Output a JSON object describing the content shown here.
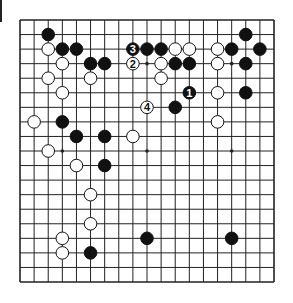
{
  "diagram": {
    "type": "go-board",
    "size": 19,
    "geometry": {
      "left": 20,
      "top": 20,
      "right": 274,
      "bottom": 282,
      "stone_radius": 6.3
    },
    "colors": {
      "line": "#222222",
      "black_stone": "#111111",
      "white_stone": "#ffffff",
      "background": "#ffffff"
    },
    "star_points": [
      [
        3,
        3
      ],
      [
        3,
        9
      ],
      [
        3,
        15
      ],
      [
        9,
        3
      ],
      [
        9,
        9
      ],
      [
        9,
        15
      ],
      [
        15,
        3
      ],
      [
        15,
        9
      ],
      [
        15,
        15
      ]
    ],
    "stones": [
      {
        "color": "black",
        "col": 2,
        "row": 1
      },
      {
        "color": "black",
        "col": 16,
        "row": 1
      },
      {
        "color": "white",
        "col": 2,
        "row": 2
      },
      {
        "color": "black",
        "col": 3,
        "row": 2
      },
      {
        "color": "black",
        "col": 4,
        "row": 2
      },
      {
        "color": "black",
        "col": 8,
        "row": 2,
        "label": "3"
      },
      {
        "color": "black",
        "col": 9,
        "row": 2
      },
      {
        "color": "black",
        "col": 10,
        "row": 2
      },
      {
        "color": "white",
        "col": 11,
        "row": 2
      },
      {
        "color": "white",
        "col": 12,
        "row": 2
      },
      {
        "color": "white",
        "col": 14,
        "row": 2
      },
      {
        "color": "black",
        "col": 15,
        "row": 2
      },
      {
        "color": "black",
        "col": 17,
        "row": 2
      },
      {
        "color": "white",
        "col": 3,
        "row": 3
      },
      {
        "color": "black",
        "col": 5,
        "row": 3
      },
      {
        "color": "black",
        "col": 6,
        "row": 3
      },
      {
        "color": "white",
        "col": 8,
        "row": 3,
        "label": "2"
      },
      {
        "color": "white",
        "col": 10,
        "row": 3
      },
      {
        "color": "black",
        "col": 11,
        "row": 3
      },
      {
        "color": "black",
        "col": 12,
        "row": 3
      },
      {
        "color": "white",
        "col": 14,
        "row": 3
      },
      {
        "color": "black",
        "col": 16,
        "row": 3
      },
      {
        "color": "white",
        "col": 2,
        "row": 4
      },
      {
        "color": "white",
        "col": 5,
        "row": 4
      },
      {
        "color": "white",
        "col": 10,
        "row": 4
      },
      {
        "color": "white",
        "col": 3,
        "row": 5
      },
      {
        "color": "black",
        "col": 12,
        "row": 5,
        "label": "1"
      },
      {
        "color": "white",
        "col": 14,
        "row": 5
      },
      {
        "color": "black",
        "col": 16,
        "row": 5
      },
      {
        "color": "white",
        "col": 9,
        "row": 6,
        "label": "4"
      },
      {
        "color": "black",
        "col": 11,
        "row": 6
      },
      {
        "color": "white",
        "col": 1,
        "row": 7
      },
      {
        "color": "black",
        "col": 3,
        "row": 7
      },
      {
        "color": "white",
        "col": 14,
        "row": 7
      },
      {
        "color": "black",
        "col": 4,
        "row": 8
      },
      {
        "color": "black",
        "col": 6,
        "row": 8
      },
      {
        "color": "white",
        "col": 8,
        "row": 8
      },
      {
        "color": "white",
        "col": 2,
        "row": 9
      },
      {
        "color": "white",
        "col": 4,
        "row": 10
      },
      {
        "color": "black",
        "col": 6,
        "row": 10
      },
      {
        "color": "white",
        "col": 5,
        "row": 12
      },
      {
        "color": "white",
        "col": 5,
        "row": 14
      },
      {
        "color": "white",
        "col": 3,
        "row": 15
      },
      {
        "color": "black",
        "col": 9,
        "row": 15
      },
      {
        "color": "black",
        "col": 15,
        "row": 15
      },
      {
        "color": "white",
        "col": 3,
        "row": 16
      },
      {
        "color": "black",
        "col": 5,
        "row": 16
      }
    ]
  }
}
